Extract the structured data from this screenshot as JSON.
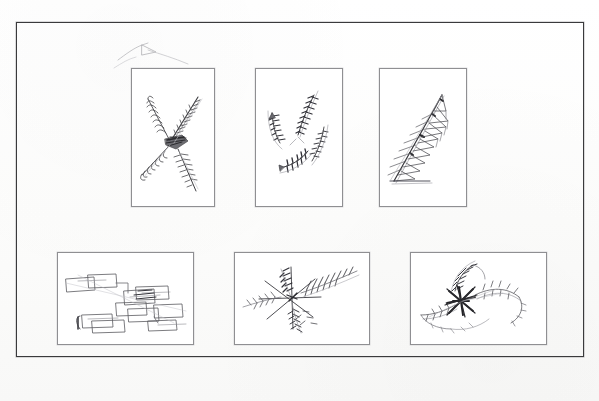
{
  "page": {
    "kind": "scanned-figure-plate",
    "background_color": "#fdfdfc",
    "frame_color": "#3a3a3c",
    "panel_border_color": "#8f8f92",
    "ink_color": "#4a4a4e",
    "dark_ink_color": "#2b2b2e"
  },
  "figure": {
    "title": "",
    "caption": "",
    "panel_count": 6,
    "rows": 2,
    "columns": 3,
    "frame": {
      "x": 16,
      "y": 22,
      "width": 566,
      "height": 333
    }
  },
  "panels": [
    {
      "id": "panel-1",
      "position": "top-left",
      "orientation": "portrait",
      "x": 131,
      "y": 68,
      "width": 82,
      "height": 137,
      "drawing_name": "x-cross-hatched-sketch",
      "description": "X-shaped crossing strokes with dense hatched feathering and dark core",
      "label": ""
    },
    {
      "id": "panel-2",
      "position": "top-center",
      "orientation": "portrait",
      "x": 255,
      "y": 68,
      "width": 86,
      "height": 137,
      "drawing_name": "pinwheel-curved-strokes-sketch",
      "description": "Four curved hatched bands arranged as a rotating pinwheel with arrow tails",
      "label": ""
    },
    {
      "id": "panel-3",
      "position": "top-right",
      "orientation": "portrait",
      "x": 379,
      "y": 68,
      "width": 86,
      "height": 137,
      "drawing_name": "triangular-ladder-sketch",
      "description": "Diagonal spine with stacked triangular rungs forming a tapering ladder",
      "label": ""
    },
    {
      "id": "panel-4",
      "position": "bottom-left",
      "orientation": "landscape",
      "x": 57,
      "y": 252,
      "width": 135,
      "height": 91,
      "drawing_name": "overlapping-boxes-cascade-sketch",
      "description": "Cascade of overlapping open rectangles descending diagonally",
      "label": ""
    },
    {
      "id": "panel-5",
      "position": "bottom-center",
      "orientation": "landscape",
      "x": 234,
      "y": 252,
      "width": 134,
      "height": 91,
      "drawing_name": "radial-feathered-cross-sketch",
      "description": "Plus-shaped axes with feathered arrow barbs radiating outward",
      "label": ""
    },
    {
      "id": "panel-6",
      "position": "bottom-right",
      "orientation": "landscape",
      "x": 410,
      "y": 252,
      "width": 135,
      "height": 91,
      "drawing_name": "asterisk-burst-s-curve-sketch",
      "description": "Dark multi-point asterisk burst with S-curved feathered wings",
      "label": ""
    }
  ],
  "stray_marks": [
    {
      "id": "stray-1",
      "name": "stray-pencil-arrow",
      "description": "Faint stray arrow/chevron pencil mark above the first panel",
      "x": 120,
      "y": 44,
      "width": 60,
      "height": 28
    }
  ]
}
